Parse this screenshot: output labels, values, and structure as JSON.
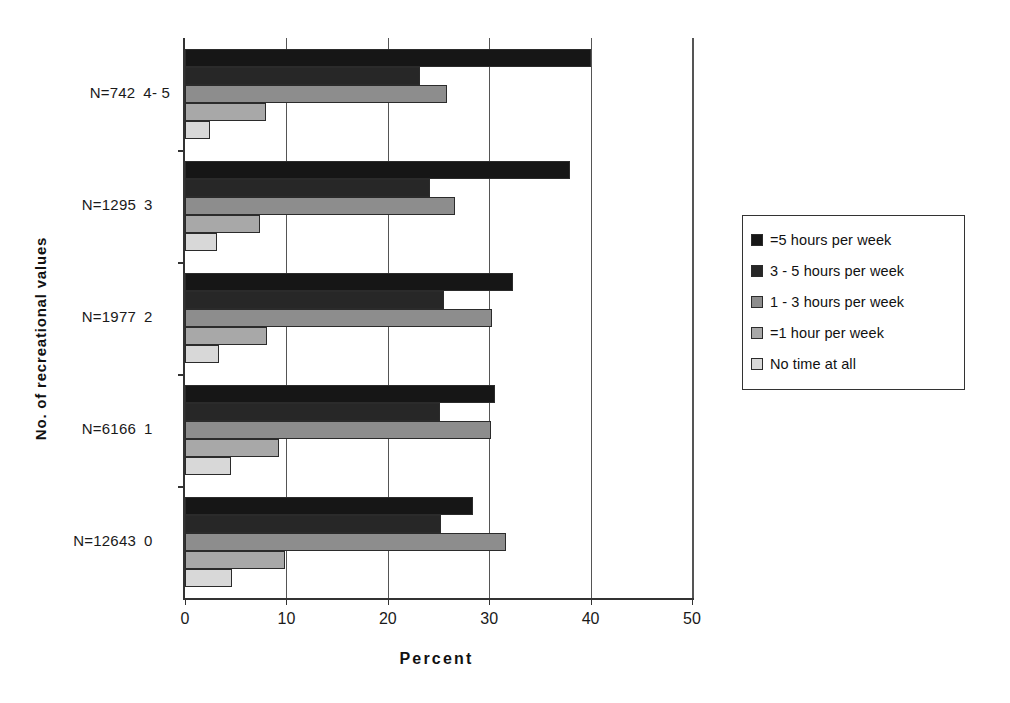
{
  "chart_data": {
    "type": "bar",
    "orientation": "horizontal",
    "title": "",
    "xlabel": "Percent",
    "ylabel": "No. of recreational values",
    "xlim": [
      0,
      50
    ],
    "xticks": [
      0,
      10,
      20,
      30,
      40,
      50
    ],
    "xtick_labels": [
      "0",
      "10",
      "20",
      "30",
      "40",
      "50"
    ],
    "grid": true,
    "grid_axis": "x",
    "legend_position": "right",
    "categories": [
      "0",
      "1",
      "2",
      "3",
      "4- 5"
    ],
    "category_labels": [
      {
        "n": "N=12643",
        "code": "0"
      },
      {
        "n": "N=6166",
        "code": "1"
      },
      {
        "n": "N=1977",
        "code": "2"
      },
      {
        "n": "N=1295",
        "code": "3"
      },
      {
        "n": "N=742",
        "code": "4- 5"
      }
    ],
    "series": [
      {
        "name": "=5 hours per week",
        "color": "#161616",
        "values": [
          28.4,
          30.6,
          32.3,
          38.0,
          40.0
        ]
      },
      {
        "name": "3 - 5 hours per week",
        "color": "#272727",
        "values": [
          25.2,
          25.1,
          25.5,
          24.2,
          23.2
        ]
      },
      {
        "name": "1 - 3 hours per week",
        "color": "#8d8d8d",
        "values": [
          31.7,
          30.2,
          30.3,
          26.6,
          25.8
        ]
      },
      {
        "name": "=1 hour per week",
        "color": "#a8a8a8",
        "values": [
          9.9,
          9.3,
          8.1,
          7.4,
          8.0
        ]
      },
      {
        "name": "No time at all",
        "color": "#d8d8d8",
        "values": [
          4.6,
          4.5,
          3.4,
          3.2,
          2.5
        ]
      }
    ]
  },
  "legend": {
    "items": [
      {
        "label": "=5 hours per week",
        "color": "#161616"
      },
      {
        "label": "3 - 5 hours per week",
        "color": "#272727"
      },
      {
        "label": "1 - 3 hours per week",
        "color": "#8d8d8d"
      },
      {
        "label": "=1 hour per week",
        "color": "#a8a8a8"
      },
      {
        "label": "No time at all",
        "color": "#d8d8d8"
      }
    ]
  },
  "axes": {
    "x_title": "Percent",
    "y_title": "No. of recreational values"
  }
}
